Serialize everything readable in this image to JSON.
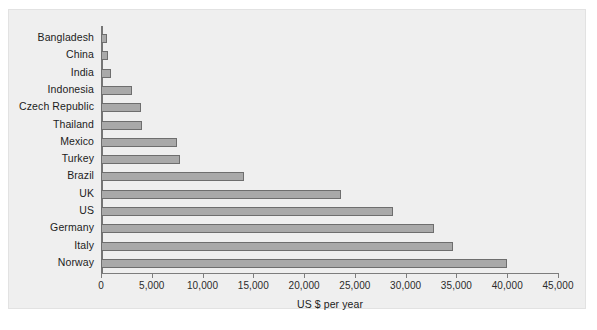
{
  "chart_data": {
    "type": "bar",
    "orientation": "horizontal",
    "title": "",
    "xlabel": "US $ per year",
    "ylabel": "",
    "xlim": [
      0,
      45000
    ],
    "xticks": [
      0,
      5000,
      10000,
      15000,
      20000,
      25000,
      30000,
      35000,
      40000,
      45000
    ],
    "xtick_labels": [
      "0",
      "5,000",
      "10,000",
      "15,000",
      "20,000",
      "25,000",
      "30,000",
      "35,000",
      "40,000",
      "45,000"
    ],
    "grid": false,
    "legend": null,
    "categories": [
      "Bangladesh",
      "China",
      "India",
      "Indonesia",
      "Czech Republic",
      "Thailand",
      "Mexico",
      "Turkey",
      "Brazil",
      "UK",
      "US",
      "Germany",
      "Italy",
      "Norway"
    ],
    "values": [
      600,
      700,
      1000,
      3050,
      3900,
      4000,
      7500,
      7800,
      14100,
      23600,
      28800,
      32800,
      34700,
      40000
    ],
    "bar_color": "#a9a9a9",
    "bar_edge_color": "#6e6e6e",
    "background_color": "#efefef",
    "axis_color": "#7d7d7d"
  }
}
